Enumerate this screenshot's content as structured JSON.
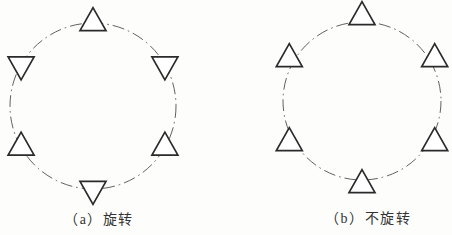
{
  "figure": {
    "background": "#fdfdfc",
    "line_color": "#4f4f4f",
    "triangle_stroke": "#2a2a2a",
    "triangle_fill": "#ffffff",
    "caption_color": "#333333"
  },
  "diagrams": [
    {
      "id": "a",
      "caption": "（a）旋转",
      "mode": "rotated",
      "center_x": 93,
      "center_y": 106,
      "radius": 83,
      "triangle_width": 26,
      "triangle_height": 23,
      "radial_offset": 0,
      "items": [
        {
          "angle_deg": 0,
          "orientation": "up"
        },
        {
          "angle_deg": 60,
          "orientation": "down"
        },
        {
          "angle_deg": 120,
          "orientation": "up"
        },
        {
          "angle_deg": 180,
          "orientation": "down"
        },
        {
          "angle_deg": 240,
          "orientation": "up"
        },
        {
          "angle_deg": 300,
          "orientation": "down"
        }
      ]
    },
    {
      "id": "b",
      "caption": "（b）不旋转",
      "mode": "not-rotated",
      "center_x": 362,
      "center_y": 101,
      "radius": 79,
      "triangle_width": 26,
      "triangle_height": 23,
      "radial_offset": 5,
      "items": [
        {
          "angle_deg": 0,
          "orientation": "up"
        },
        {
          "angle_deg": 60,
          "orientation": "up"
        },
        {
          "angle_deg": 120,
          "orientation": "up"
        },
        {
          "angle_deg": 180,
          "orientation": "up"
        },
        {
          "angle_deg": 240,
          "orientation": "up"
        },
        {
          "angle_deg": 300,
          "orientation": "up"
        }
      ]
    }
  ]
}
